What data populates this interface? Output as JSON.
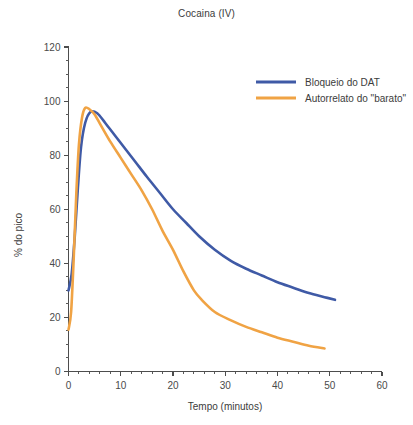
{
  "chart_data": {
    "type": "line",
    "title": "Cocaina (IV)",
    "xlabel": "Tempo (minutos)",
    "ylabel": "% do pico",
    "xlim": [
      0,
      60
    ],
    "ylim": [
      0,
      120
    ],
    "x_ticks": [
      0,
      10,
      20,
      30,
      40,
      50,
      60
    ],
    "y_ticks": [
      0,
      20,
      40,
      60,
      80,
      100,
      120
    ],
    "x_minor_step": 2,
    "y_minor_step": 5,
    "grid": false,
    "legend_position": "top-right",
    "series": [
      {
        "name": "Bloqueio do DAT",
        "color": "#3f5aa6",
        "x": [
          0,
          0.6,
          1.2,
          1.8,
          2.4,
          3.2,
          4.2,
          5.5,
          7,
          9,
          11,
          13,
          15,
          17.5,
          20,
          22.5,
          25,
          28,
          31,
          34,
          37,
          40,
          43,
          46,
          49,
          51
        ],
        "y": [
          30,
          36,
          50,
          68,
          83,
          92,
          96,
          95.5,
          92,
          87,
          82,
          77,
          72,
          66,
          60,
          55,
          50,
          45,
          41,
          38,
          35.5,
          33,
          31,
          29,
          27.5,
          26.5
        ]
      },
      {
        "name": "Autorrelato do \"barato\"",
        "color": "#f0a344",
        "x": [
          0,
          0.5,
          1,
          1.5,
          2,
          2.6,
          3.2,
          4,
          5,
          6.5,
          8,
          10,
          12,
          14,
          16,
          18,
          20,
          22,
          24,
          25.5,
          28,
          31,
          34,
          37,
          40,
          43,
          46,
          49
        ],
        "y": [
          15.5,
          22,
          42,
          66,
          84,
          94,
          97.5,
          97,
          95,
          90,
          85,
          79,
          73,
          67,
          60,
          52,
          45,
          37,
          30,
          26.5,
          22,
          19,
          16.5,
          14.5,
          12.5,
          11,
          9.5,
          8.5
        ]
      }
    ],
    "legend": [
      {
        "label": "Bloqueio do DAT",
        "color": "#3f5aa6"
      },
      {
        "label": "Autorrelato do \"barato\"",
        "color": "#f0a344"
      }
    ]
  },
  "axes": {
    "x_tick_labels": [
      "0",
      "10",
      "20",
      "30",
      "40",
      "50",
      "60"
    ],
    "y_tick_labels": [
      "0",
      "20",
      "40",
      "60",
      "80",
      "100",
      "120"
    ]
  }
}
